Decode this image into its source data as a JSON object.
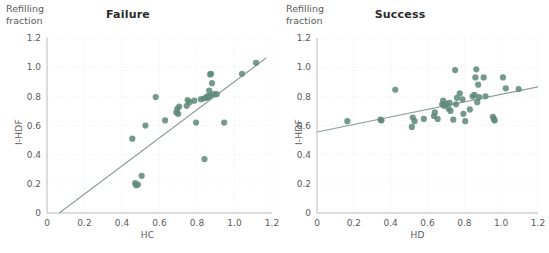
{
  "figure": {
    "width": 549,
    "height": 253,
    "background": "#ffffff",
    "marker_color": "#5d8878",
    "marker_opacity": 0.85,
    "line_color": "#8d9e97",
    "grid_color": "#e6e6e6",
    "axis_color": "#b9b9b9",
    "text_color": "#5a5a5a",
    "title_color": "#2b2b2b"
  },
  "panels": [
    {
      "id": "failure",
      "title": "Failure",
      "corner_label": "Refilling\nfraction",
      "xlabel": "HC",
      "ylabel": "I-HDF"
    },
    {
      "id": "success",
      "title": "Success",
      "corner_label": "Refilling\nfraction",
      "xlabel": "HD",
      "ylabel": "I-HDF"
    }
  ],
  "chart_data": [
    {
      "type": "scatter",
      "title": "Failure",
      "xlabel": "HC",
      "ylabel": "I-HDF",
      "corner_label": "Refilling fraction",
      "xlim": [
        0,
        1.2
      ],
      "ylim": [
        0,
        1.2
      ],
      "xticks": [
        0,
        0.2,
        0.4,
        0.6,
        0.8,
        1.0,
        1.2
      ],
      "xticklabels": [
        "0",
        "0.2",
        "0.4",
        "0.6",
        "0.8",
        "1.0",
        "1.2"
      ],
      "yticks": [
        0,
        0.2,
        0.4,
        0.6,
        0.8,
        1.0,
        1.2
      ],
      "yticklabels": [
        "0",
        "0.2",
        "0.4",
        "0.6",
        "0.8",
        "1.0",
        "1.2"
      ],
      "grid": "dotted-both",
      "legend": "none",
      "points": [
        [
          0.455,
          0.51
        ],
        [
          0.47,
          0.205
        ],
        [
          0.475,
          0.19
        ],
        [
          0.485,
          0.195
        ],
        [
          0.505,
          0.255
        ],
        [
          0.525,
          0.6
        ],
        [
          0.58,
          0.795
        ],
        [
          0.63,
          0.635
        ],
        [
          0.69,
          0.69
        ],
        [
          0.695,
          0.715
        ],
        [
          0.7,
          0.68
        ],
        [
          0.705,
          0.73
        ],
        [
          0.745,
          0.735
        ],
        [
          0.75,
          0.775
        ],
        [
          0.76,
          0.76
        ],
        [
          0.785,
          0.77
        ],
        [
          0.795,
          0.62
        ],
        [
          0.82,
          0.78
        ],
        [
          0.835,
          0.785
        ],
        [
          0.84,
          0.37
        ],
        [
          0.85,
          0.79
        ],
        [
          0.855,
          0.8
        ],
        [
          0.86,
          0.795
        ],
        [
          0.865,
          0.84
        ],
        [
          0.87,
          0.805
        ],
        [
          0.87,
          0.95
        ],
        [
          0.875,
          0.955
        ],
        [
          0.88,
          0.89
        ],
        [
          0.89,
          0.815
        ],
        [
          0.905,
          0.815
        ],
        [
          0.945,
          0.62
        ],
        [
          1.04,
          0.955
        ],
        [
          1.115,
          1.03
        ]
      ],
      "fit_line": {
        "x": [
          0.065,
          1.17
        ],
        "y": [
          0.0,
          1.065
        ]
      }
    },
    {
      "type": "scatter",
      "title": "Success",
      "xlabel": "HD",
      "ylabel": "I-HDF",
      "corner_label": "Refilling fraction",
      "xlim": [
        0,
        1.2
      ],
      "ylim": [
        0,
        1.2
      ],
      "xticks": [
        0,
        0.2,
        0.4,
        0.6,
        0.8,
        1.0,
        1.2
      ],
      "xticklabels": [
        "0",
        "0.2",
        "0.4",
        "0.6",
        "0.8",
        "1.0",
        "1.2"
      ],
      "yticks": [
        0,
        0.2,
        0.4,
        0.6,
        0.8,
        1.0,
        1.2
      ],
      "yticklabels": [
        "0",
        "0.2",
        "0.4",
        "0.6",
        "0.8",
        "1.0",
        "1.2"
      ],
      "grid": "dotted-both",
      "legend": "none",
      "points": [
        [
          0.165,
          0.63
        ],
        [
          0.345,
          0.64
        ],
        [
          0.35,
          0.635
        ],
        [
          0.425,
          0.845
        ],
        [
          0.515,
          0.59
        ],
        [
          0.52,
          0.655
        ],
        [
          0.53,
          0.63
        ],
        [
          0.58,
          0.645
        ],
        [
          0.635,
          0.665
        ],
        [
          0.64,
          0.69
        ],
        [
          0.655,
          0.645
        ],
        [
          0.68,
          0.745
        ],
        [
          0.685,
          0.77
        ],
        [
          0.69,
          0.735
        ],
        [
          0.7,
          0.75
        ],
        [
          0.715,
          0.715
        ],
        [
          0.72,
          0.755
        ],
        [
          0.725,
          0.7
        ],
        [
          0.74,
          0.64
        ],
        [
          0.75,
          0.98
        ],
        [
          0.755,
          0.745
        ],
        [
          0.76,
          0.79
        ],
        [
          0.775,
          0.82
        ],
        [
          0.79,
          0.78
        ],
        [
          0.795,
          0.68
        ],
        [
          0.805,
          0.63
        ],
        [
          0.83,
          0.71
        ],
        [
          0.845,
          0.8
        ],
        [
          0.855,
          0.81
        ],
        [
          0.86,
          0.93
        ],
        [
          0.865,
          0.985
        ],
        [
          0.87,
          0.76
        ],
        [
          0.875,
          0.88
        ],
        [
          0.88,
          0.795
        ],
        [
          0.905,
          0.93
        ],
        [
          0.915,
          0.8
        ],
        [
          0.955,
          0.66
        ],
        [
          0.96,
          0.645
        ],
        [
          0.965,
          0.635
        ],
        [
          1.01,
          0.93
        ],
        [
          1.025,
          0.855
        ],
        [
          1.095,
          0.85
        ]
      ],
      "fit_line": {
        "x": [
          0.0,
          1.2
        ],
        "y": [
          0.555,
          0.865
        ]
      }
    }
  ]
}
